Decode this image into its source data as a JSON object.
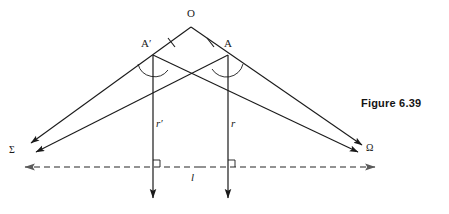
{
  "figure": {
    "caption": "Figure 6.39",
    "caption_position": {
      "x": 361,
      "y": 97
    },
    "type": "geometry-diagram",
    "background_color": "#ffffff",
    "stroke_color": "#1a1a1a",
    "dash_color": "#7a7a7a"
  },
  "points": {
    "apex": {
      "label": "O",
      "x": 191,
      "y": 27,
      "label_x": 187,
      "label_y": 10
    },
    "left_vertex": {
      "label": "A′",
      "x": 153,
      "y": 55,
      "label_x": 143,
      "label_y": 40
    },
    "right_vertex": {
      "label": "A",
      "x": 228,
      "y": 55,
      "label_x": 224,
      "label_y": 40
    },
    "left_target": {
      "label": "Σ",
      "x": 22,
      "y": 152,
      "label_x": 11,
      "label_y": 147
    },
    "right_target": {
      "label": "Ω",
      "x": 372,
      "y": 150,
      "label_x": 368,
      "label_y": 145
    }
  },
  "labels": {
    "left_normal": {
      "text": "r′",
      "x": 157,
      "y": 124
    },
    "right_normal": {
      "text": "r",
      "x": 232,
      "y": 124
    },
    "base_line": {
      "text": "l",
      "x": 193,
      "y": 177
    }
  },
  "elements": {
    "tick_marks": {
      "name": "congruence-ticks",
      "count": 2,
      "on": [
        "O-A′",
        "O-A"
      ]
    },
    "angle_arcs": {
      "name": "angle-arcs",
      "count": 2,
      "at": [
        "A′",
        "A"
      ]
    },
    "right_angles": {
      "name": "right-angle-marks",
      "count": 2,
      "at": [
        {
          "x": 153,
          "y": 167
        },
        {
          "x": 228,
          "y": 167
        }
      ]
    },
    "dashed_line": {
      "name": "line-l",
      "x1": 22,
      "x2": 378,
      "y": 167,
      "style": "dashed",
      "arrows": "both"
    },
    "normals": [
      {
        "name": "normal-r-prime",
        "x": 153,
        "y1": 55,
        "y2": 201,
        "arrow": "down"
      },
      {
        "name": "normal-r",
        "x": 228,
        "y1": 55,
        "y2": 201,
        "arrow": "down"
      }
    ],
    "rays": [
      {
        "name": "ray-O-to-Sigma",
        "from": "O",
        "through": "A′",
        "to": "Σ",
        "arrow": "end"
      },
      {
        "name": "ray-O-to-Omega",
        "from": "O",
        "through": "A",
        "to": "Ω",
        "arrow": "end"
      },
      {
        "name": "ray-A-to-Sigma",
        "from": "A",
        "to": "Σ",
        "arrow": "end"
      },
      {
        "name": "ray-A-prime-to-Omega",
        "from": "A′",
        "to": "Ω",
        "arrow": "end"
      }
    ]
  }
}
